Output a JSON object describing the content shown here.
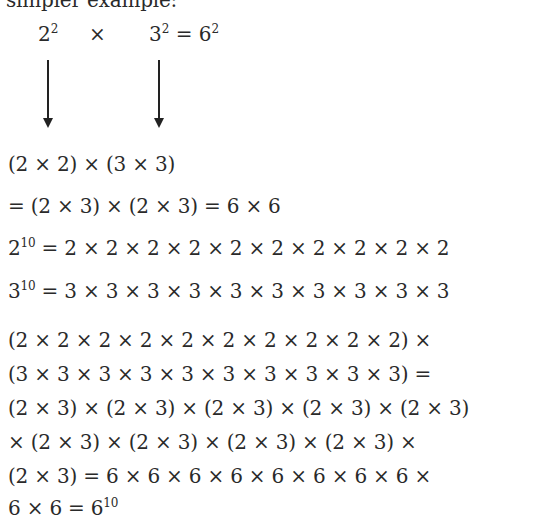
{
  "intro_fragment": "simpler example:",
  "top_row": {
    "base_a": "2",
    "exp_a": "2",
    "times": "×",
    "base_b": "3",
    "exp_b": "2",
    "equals": "=",
    "base_c": "6",
    "exp_c": "2"
  },
  "lines": {
    "l1": "(2 × 2) × (3 × 3)",
    "l2": "= (2 × 3) × (2 × 3) = 6 × 6",
    "l3_base": "2",
    "l3_exp": "10",
    "l3_rest": " = 2 × 2 × 2 × 2 × 2 × 2 × 2 × 2 × 2 × 2",
    "l4_base": "3",
    "l4_exp": "10",
    "l4_rest": " = 3 × 3 × 3 × 3 × 3 × 3 × 3 × 3 × 3 × 3",
    "p1": "(2 × 2 × 2 × 2 × 2 × 2 × 2 × 2 × 2 × 2) ×",
    "p2": "(3 × 3 × 3 × 3 × 3 × 3 × 3 × 3 × 3 × 3) =",
    "p3": "(2 × 3) × (2 × 3) × (2 × 3) × (2 × 3) × (2 × 3)",
    "p4": "× (2 × 3) × (2 × 3) × (2 × 3) × (2 × 3) ×",
    "p5": "(2 × 3) = 6 × 6 × 6 × 6 × 6 × 6 × 6 × 6 ×",
    "p6_text": "6 × 6 = 6",
    "p6_exp": "10"
  }
}
